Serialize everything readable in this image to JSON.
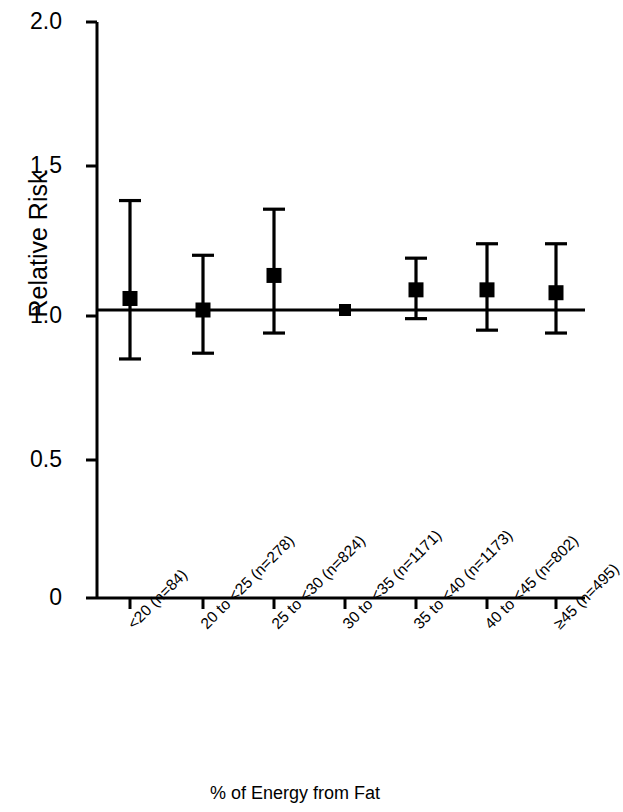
{
  "chart_data": {
    "type": "scatter",
    "title": "",
    "subtitle": "",
    "xlabel": "% of Energy from Fat",
    "ylabel": "Relative Risk",
    "ylim": [
      0,
      2.0
    ],
    "yticks": [
      "0",
      "0.5",
      "1.0",
      "1.5",
      "2.0"
    ],
    "ytick_values": [
      0,
      0.5,
      1.0,
      1.5,
      2.0
    ],
    "grid": false,
    "legend": null,
    "reference_line": 1.0,
    "categories": [
      "<20 (n=84)",
      "20 to <25 (n=278)",
      "25 to <30 (n=824)",
      "30 to <35 (n=1171)",
      "35 to <40 (n=1173)",
      "40 to <45 (n=802)",
      "≥45 (n=495)"
    ],
    "values": [
      1.04,
      1.0,
      1.12,
      1.0,
      1.07,
      1.07,
      1.06
    ],
    "ci_lower": [
      0.83,
      0.85,
      0.92,
      null,
      0.97,
      0.93,
      0.92
    ],
    "ci_upper": [
      1.38,
      1.19,
      1.35,
      null,
      1.18,
      1.23,
      1.23
    ],
    "series": [
      {
        "name": "Relative Risk",
        "values": [
          1.04,
          1.0,
          1.12,
          1.0,
          1.07,
          1.07,
          1.06
        ],
        "ci_lower": [
          0.83,
          0.85,
          0.92,
          null,
          0.97,
          0.93,
          0.92
        ],
        "ci_upper": [
          1.38,
          1.19,
          1.35,
          null,
          1.18,
          1.23,
          1.23
        ]
      }
    ],
    "marker": "filled-square",
    "color": "#000000"
  },
  "axis": {
    "y_title": "Relative Risk",
    "x_title": "% of Energy from Fat"
  }
}
